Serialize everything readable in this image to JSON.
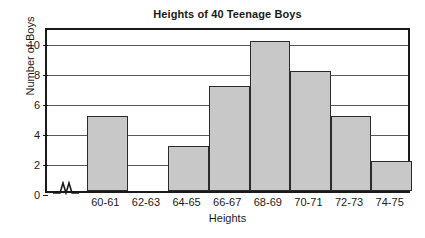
{
  "chart_data": {
    "type": "bar",
    "title": "Heights of 40 Teenage Boys",
    "xlabel": "Heights",
    "ylabel": "Number of Boys",
    "categories": [
      "60-61",
      "62-63",
      "64-65",
      "66-67",
      "68-69",
      "70-71",
      "72-73",
      "74-75"
    ],
    "values": [
      5,
      0,
      3,
      7,
      10,
      8,
      5,
      2
    ],
    "ylim": [
      0,
      11
    ],
    "yticks": [
      0,
      2,
      4,
      6,
      8,
      10
    ],
    "ytick_labels": [
      "0",
      "2",
      "4",
      "6",
      "8",
      "10"
    ],
    "gridlines": [
      2,
      4,
      6,
      8,
      10
    ],
    "grid": true,
    "legend": "none",
    "axis_break": "x-axis-break-zigzag",
    "bar_fill_color": "#c8c8c8",
    "bar_edge_color": "#2b2b2b",
    "frame_color": "#1a1a1a",
    "background_color": "#ffffff"
  }
}
